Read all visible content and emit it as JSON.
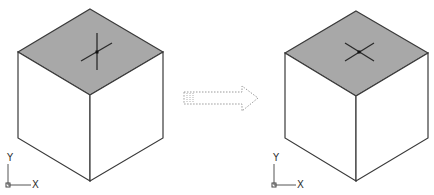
{
  "diagram": {
    "type": "before-after-transformation",
    "colors": {
      "background": "#ffffff",
      "top_face_fill": "#a8a8a8",
      "edge_stroke": "#3a3a3a",
      "crosshair": "#2a2a2a",
      "arrow_stroke": "#9a9a9a"
    },
    "panels": [
      {
        "name": "before",
        "cube": {
          "top": [
            90,
            9
          ],
          "left": [
            18,
            52
          ],
          "right": [
            163,
            52
          ],
          "front": [
            90,
            95
          ],
          "left_bottom": [
            18,
            138
          ],
          "right_bottom": [
            163,
            138
          ],
          "front_bottom": [
            90,
            181
          ]
        },
        "crosshair": {
          "style": "vertical-plus-diagonal",
          "center": [
            97,
            52
          ]
        },
        "ucs_icon": {
          "origin": [
            8,
            185
          ],
          "x_label": "X",
          "y_label": "Y"
        }
      },
      {
        "name": "after",
        "cube": {
          "top": [
            356,
            11
          ],
          "left": [
            285,
            53
          ],
          "right": [
            428,
            53
          ],
          "front": [
            356,
            96
          ],
          "left_bottom": [
            285,
            138
          ],
          "right_bottom": [
            428,
            138
          ],
          "front_bottom": [
            356,
            181
          ]
        },
        "crosshair": {
          "style": "isometric-x",
          "center": [
            359,
            52
          ]
        },
        "ucs_icon": {
          "origin": [
            274,
            185
          ],
          "x_label": "X",
          "y_label": "Y"
        }
      }
    ],
    "arrow": {
      "direction": "right",
      "style": "dotted-hollow"
    }
  }
}
